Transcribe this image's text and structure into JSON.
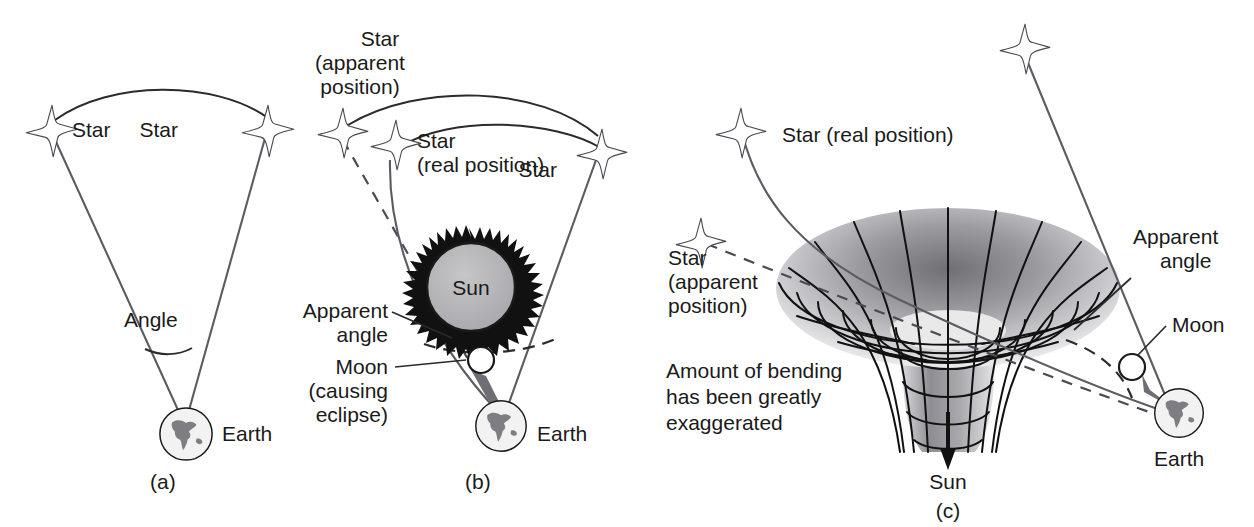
{
  "figure": {
    "background_color": "#ffffff",
    "ink_color": "#1a1a1a",
    "ray_color": "#5b5b63"
  },
  "panels": [
    {
      "id": "a",
      "caption": "(a)",
      "labels": {
        "star_left": "Star",
        "star_right": "Star",
        "angle": "Angle",
        "earth": "Earth"
      }
    },
    {
      "id": "b",
      "caption": "(b)",
      "labels": {
        "star_apparent": "Star\n(apparent\nposition)",
        "star_apparent_l1": "Star",
        "star_apparent_l2": "(apparent",
        "star_apparent_l3": "position)",
        "star_real_l1": "Star",
        "star_real_l2": "(real position)",
        "star_right": "Star",
        "sun": "Sun",
        "apparent_angle_l1": "Apparent",
        "apparent_angle_l2": "angle",
        "moon_l1": "Moon",
        "moon_l2": "(causing",
        "moon_l3": "eclipse)",
        "earth": "Earth"
      }
    },
    {
      "id": "c",
      "caption": "(c)",
      "labels": {
        "star_real": "Star (real position)",
        "star_apparent_l1": "Star",
        "star_apparent_l2": "(apparent",
        "star_apparent_l3": "position)",
        "note_l1": "Amount of bending",
        "note_l2": "has been greatly",
        "note_l3": "exaggerated",
        "apparent_angle_l1": "Apparent",
        "apparent_angle_l2": "angle",
        "moon": "Moon",
        "earth": "Earth",
        "sun_arrow": "Sun"
      }
    }
  ]
}
